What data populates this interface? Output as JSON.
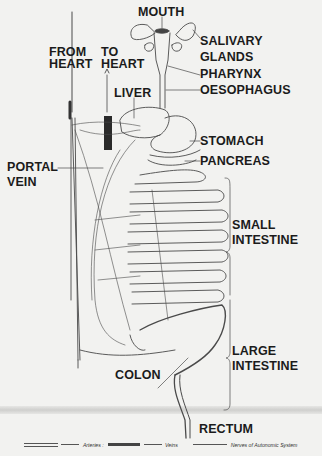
{
  "diagram": {
    "labels": {
      "mouth": "MOUTH",
      "from_heart_1": "FROM",
      "from_heart_2": "HEART",
      "to_heart_1": "TO",
      "to_heart_2": "HEART",
      "salivary_1": "SALIVARY",
      "salivary_2": "GLANDS",
      "pharynx": "PHARYNX",
      "liver": "LIVER",
      "oesophagus": "OESOPHAGUS",
      "stomach": "STOMACH",
      "portal_1": "PORTAL",
      "portal_2": "VEIN",
      "pancreas": "PANCREAS",
      "small_1": "SMALL",
      "small_2": "INTESTINE",
      "large_1": "LARGE",
      "large_2": "INTESTINE",
      "colon": "COLON",
      "rectum": "RECTUM"
    },
    "legend": {
      "arteries": "Arteries :",
      "veins": "Veins",
      "nerves": "Nerves of Autonomic System"
    },
    "colors": {
      "background": "#f2f2f0",
      "ink": "#1b1b1b",
      "line": "#555555"
    }
  }
}
